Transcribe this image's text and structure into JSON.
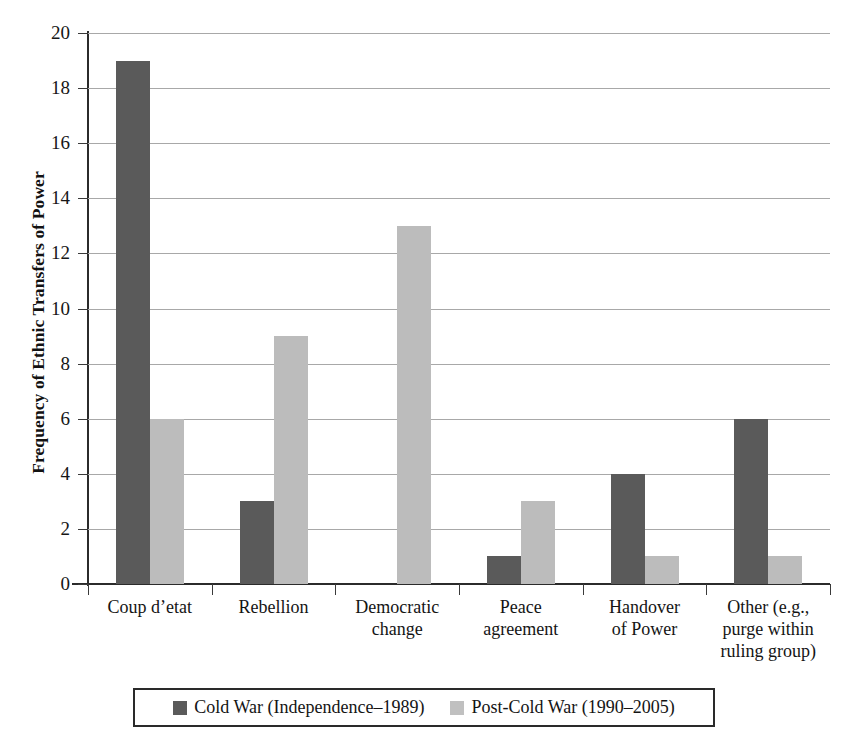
{
  "chart_data": {
    "type": "bar",
    "title": "",
    "xlabel": "",
    "ylabel": "Frequency of Ethnic Transfers of Power",
    "ylim": [
      0,
      20
    ],
    "ytick_step": 2,
    "yticks": [
      20,
      18,
      16,
      14,
      12,
      10,
      8,
      6,
      4,
      2,
      0
    ],
    "grid": true,
    "legend_position": "bottom",
    "categories": [
      "Coup d’etat",
      "Rebellion",
      "Democratic change",
      "Peace agreement",
      "Handover of Power",
      "Other (e.g., purge within ruling group)"
    ],
    "category_label_lines": [
      [
        "Coup d’etat"
      ],
      [
        "Rebellion"
      ],
      [
        "Democratic",
        "change"
      ],
      [
        "Peace",
        "agreement"
      ],
      [
        "Handover",
        "of Power"
      ],
      [
        "Other (e.g.,",
        "purge within",
        "ruling group)"
      ]
    ],
    "series": [
      {
        "name": "Cold War (Independence–1989)",
        "color": "#5a5a5a",
        "values": [
          19,
          3,
          0,
          1,
          4,
          6
        ]
      },
      {
        "name": "Post-Cold War (1990–2005)",
        "color": "#bcbcbc",
        "values": [
          6,
          9,
          13,
          3,
          1,
          1
        ]
      }
    ]
  },
  "legend": {
    "items": [
      {
        "label": "Cold War (Independence–1989)",
        "color": "#5a5a5a"
      },
      {
        "label": "Post-Cold War (1990–2005)",
        "color": "#c0c0c0"
      }
    ]
  }
}
